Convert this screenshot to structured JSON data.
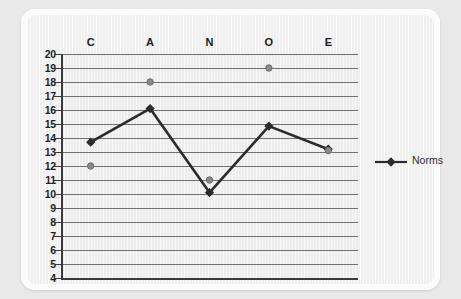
{
  "chart_data": {
    "type": "line",
    "title": "",
    "xlabel": "",
    "ylabel": "",
    "categories": [
      "C",
      "A",
      "N",
      "O",
      "E"
    ],
    "ylim": [
      4,
      20
    ],
    "ytick_step": 1,
    "yticks": [
      20,
      19,
      18,
      17,
      16,
      15,
      14,
      13,
      12,
      11,
      10,
      9,
      8,
      7,
      6,
      5,
      4
    ],
    "grid": true,
    "legend_position": "right",
    "series": [
      {
        "name": "Norms",
        "marker": "diamond",
        "style": "line-with-markers",
        "color": "#2b2b2d",
        "values": [
          13.7,
          16.1,
          10.1,
          14.85,
          13.2
        ]
      },
      {
        "name": "",
        "marker": "circle",
        "style": "markers-only",
        "color": "#8a8a8c",
        "values": [
          12.0,
          18.0,
          11.0,
          19.0,
          13.1
        ]
      }
    ],
    "legend": [
      {
        "label": "Norms",
        "marker": "diamond",
        "color": "#2b2b2d"
      }
    ]
  },
  "colors": {
    "page_background": "#e9e9ea",
    "card_background": "#fbfbfb",
    "plot_background": "#f0f0f0",
    "gridline": "#6f7072",
    "axis": "#3a3a3c",
    "series_norms": "#2b2b2d",
    "series_scores": "#8a8a8c",
    "tick_label": "#1d1d1f"
  }
}
